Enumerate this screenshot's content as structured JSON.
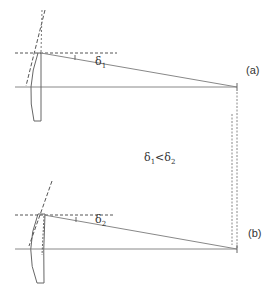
{
  "diagram": {
    "panel_a": {
      "label": "(a)",
      "angle_symbol": "δ",
      "angle_subscript": "1"
    },
    "panel_b": {
      "label": "(b)",
      "angle_symbol": "δ",
      "angle_subscript": "2"
    },
    "comparison": {
      "left_symbol": "δ",
      "left_subscript": "1",
      "operator": "<",
      "right_symbol": "δ",
      "right_subscript": "2"
    },
    "colors": {
      "line": "#888888",
      "dashed": "#555555",
      "text": "#333333"
    }
  }
}
